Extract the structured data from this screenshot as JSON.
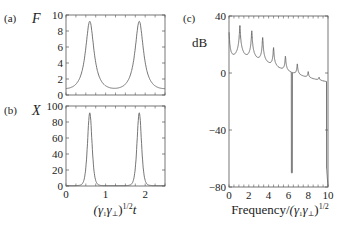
{
  "figure": {
    "panels": [
      {
        "id": "a",
        "label": "(a)",
        "var": "F"
      },
      {
        "id": "b",
        "label": "(b)",
        "var": "X"
      },
      {
        "id": "c",
        "label": "(c)",
        "ylabel": "dB"
      }
    ],
    "shared_xlabel_ab": "(γ₁γ₁)¹ᐟ²t",
    "xlabel_c": "Frequency/(γ₁γ₁)¹ᐟ²"
  },
  "chart_data": [
    {
      "type": "line",
      "panel": "a",
      "title": "",
      "ylabel": "F",
      "xlabel": "",
      "xlim": [
        0,
        2.5
      ],
      "ylim": [
        0,
        10
      ],
      "yticks": [
        0,
        2,
        4,
        6,
        8,
        10
      ],
      "series": [
        {
          "name": "F",
          "peaks": [
            {
              "x": 0.6,
              "y": 9.5
            },
            {
              "x": 1.85,
              "y": 9.5
            }
          ],
          "minimum": {
            "x": 1.22,
            "y": 0.8
          },
          "start": {
            "x": 0,
            "y": 1.0
          },
          "end": {
            "x": 2.5,
            "y": 0.9
          }
        }
      ]
    },
    {
      "type": "line",
      "panel": "b",
      "ylabel": "X",
      "xlabel": "(γ₁γ₁)^(1/2) t",
      "xlim": [
        0,
        2.5
      ],
      "ylim": [
        0,
        100
      ],
      "xticks": [
        0,
        1,
        2
      ],
      "yticks": [
        0,
        20,
        40,
        60,
        80,
        100
      ],
      "series": [
        {
          "name": "X",
          "peaks": [
            {
              "x": 0.6,
              "y": 91
            },
            {
              "x": 1.85,
              "y": 91
            }
          ],
          "baseline": 1
        }
      ]
    },
    {
      "type": "line",
      "panel": "c",
      "ylabel": "dB",
      "xlabel": "Frequency/(γ₁γ₁)^(1/2)",
      "xlim": [
        0,
        10
      ],
      "ylim": [
        -80,
        40
      ],
      "xticks": [
        0,
        2,
        4,
        6,
        8,
        10
      ],
      "yticks": [
        -80,
        -40,
        0,
        40
      ],
      "series": [
        {
          "name": "spectrum",
          "peaks": [
            {
              "x": 0.0,
              "y": 28
            },
            {
              "x": 1.1,
              "y": 33
            },
            {
              "x": 2.3,
              "y": 29
            },
            {
              "x": 3.4,
              "y": 24
            },
            {
              "x": 4.5,
              "y": 16
            },
            {
              "x": 5.7,
              "y": 9
            },
            {
              "x": 6.9,
              "y": 2
            },
            {
              "x": 8.0,
              "y": -7
            },
            {
              "x": 9.1,
              "y": -16
            },
            {
              "x": 9.7,
              "y": -44
            }
          ],
          "valleys": [
            {
              "x": 0.3,
              "y": -22
            },
            {
              "x": 1.7,
              "y": -10
            },
            {
              "x": 2.8,
              "y": -13
            },
            {
              "x": 3.9,
              "y": -19
            },
            {
              "x": 5.0,
              "y": -27
            },
            {
              "x": 6.1,
              "y": -55
            },
            {
              "x": 6.4,
              "y": -70
            },
            {
              "x": 7.4,
              "y": -55
            },
            {
              "x": 8.6,
              "y": -60
            },
            {
              "x": 9.5,
              "y": -66
            },
            {
              "x": 10,
              "y": -80
            }
          ]
        }
      ]
    }
  ]
}
